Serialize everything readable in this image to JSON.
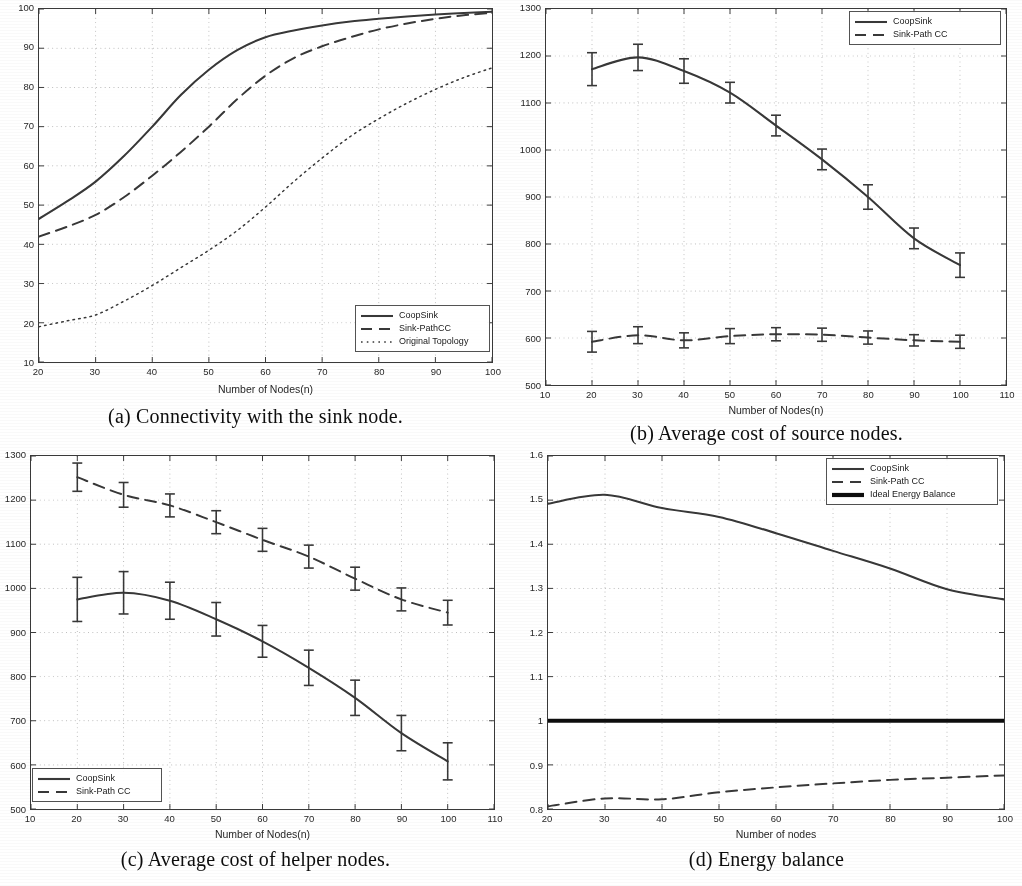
{
  "figure": {
    "panels": [
      "a",
      "b",
      "c",
      "d"
    ],
    "colors": {
      "line": "#3b3b3b",
      "thick": "#111111",
      "grid": "#b9b9b9",
      "axis": "#3c3c3c",
      "text": "#222222"
    }
  },
  "panel_a": {
    "caption": "(a) Connectivity with the sink node.",
    "xlabel": "Number of Nodes(n)",
    "ylabel": "",
    "xticks": [
      "20",
      "30",
      "40",
      "50",
      "60",
      "70",
      "80",
      "90",
      "100"
    ],
    "yticks": [
      "100",
      "90",
      "80",
      "70",
      "60",
      "50",
      "40",
      "30",
      "20",
      "10"
    ],
    "legend": [
      {
        "label": "CoopSink",
        "style": "solid"
      },
      {
        "label": "Sink-PathCC",
        "style": "dashed"
      },
      {
        "label": "Original Topology",
        "style": "dotted"
      }
    ]
  },
  "panel_b": {
    "caption": "(b) Average cost of source nodes.",
    "xlabel": "Number of Nodes(n)",
    "ylabel": "",
    "xticks": [
      "10",
      "20",
      "30",
      "40",
      "50",
      "60",
      "70",
      "80",
      "90",
      "100",
      "110"
    ],
    "yticks": [
      "1300",
      "1200",
      "1100",
      "1000",
      "900",
      "800",
      "700",
      "600",
      "500"
    ],
    "legend": [
      {
        "label": "CoopSink",
        "style": "solid"
      },
      {
        "label": "Sink-Path CC",
        "style": "dashed"
      }
    ]
  },
  "panel_c": {
    "caption": "(c) Average cost of helper nodes.",
    "xlabel": "Number of Nodes(n)",
    "ylabel": "",
    "xticks": [
      "10",
      "20",
      "30",
      "40",
      "50",
      "60",
      "70",
      "80",
      "90",
      "100",
      "110"
    ],
    "yticks": [
      "1300",
      "1200",
      "1100",
      "1000",
      "900",
      "800",
      "700",
      "600",
      "500"
    ],
    "legend": [
      {
        "label": "CoopSink",
        "style": "solid"
      },
      {
        "label": "Sink-Path CC",
        "style": "dashed"
      }
    ]
  },
  "panel_d": {
    "caption": "(d) Energy balance",
    "xlabel": "Number of nodes",
    "ylabel": "",
    "xticks": [
      "20",
      "30",
      "40",
      "50",
      "60",
      "70",
      "80",
      "90",
      "100"
    ],
    "yticks": [
      "1.6",
      "1.5",
      "1.4",
      "1.3",
      "1.2",
      "1.1",
      "1",
      "0.9",
      "0.8"
    ],
    "legend": [
      {
        "label": "CoopSink",
        "style": "solid"
      },
      {
        "label": "Sink-Path CC",
        "style": "dashed"
      },
      {
        "label": "Ideal Energy Balance",
        "style": "thick"
      }
    ]
  },
  "chart_data": [
    {
      "id": "a",
      "type": "line",
      "title": "(a) Connectivity with the sink node.",
      "xlabel": "Number of Nodes(n)",
      "ylabel": "",
      "xlim": [
        20,
        100
      ],
      "ylim": [
        10,
        100
      ],
      "grid": true,
      "legend_position": "lower-right",
      "x": [
        20,
        25,
        30,
        35,
        40,
        45,
        50,
        55,
        60,
        65,
        70,
        75,
        80,
        85,
        90,
        95,
        100
      ],
      "series": [
        {
          "name": "CoopSink",
          "style": "solid",
          "values": [
            46.5,
            51.0,
            56.0,
            62.5,
            70.0,
            78.0,
            84.5,
            89.5,
            92.8,
            94.5,
            95.8,
            96.8,
            97.5,
            98.1,
            98.6,
            99.0,
            99.3
          ]
        },
        {
          "name": "Sink-PathCC",
          "style": "dashed",
          "values": [
            42.0,
            44.5,
            47.5,
            52.0,
            57.5,
            63.5,
            70.0,
            77.0,
            83.0,
            87.5,
            90.5,
            92.8,
            94.8,
            96.3,
            97.5,
            98.4,
            99.0
          ]
        },
        {
          "name": "Original Topology",
          "style": "dotted",
          "values": [
            19.0,
            20.5,
            22.0,
            25.5,
            29.5,
            34.0,
            38.5,
            43.5,
            49.5,
            56.0,
            62.0,
            67.5,
            72.0,
            76.0,
            79.5,
            82.5,
            85.0
          ]
        }
      ]
    },
    {
      "id": "b",
      "type": "line",
      "title": "(b) Average cost of source nodes.",
      "xlabel": "Number of Nodes(n)",
      "ylabel": "",
      "xlim": [
        10,
        110
      ],
      "ylim": [
        500,
        1300
      ],
      "grid": true,
      "legend_position": "upper-right",
      "errorbars": true,
      "x": [
        20,
        30,
        40,
        50,
        60,
        70,
        80,
        90,
        100
      ],
      "series": [
        {
          "name": "CoopSink",
          "style": "solid",
          "values": [
            1172,
            1197,
            1168,
            1122,
            1052,
            980,
            900,
            812,
            755
          ],
          "errors": [
            35,
            28,
            26,
            22,
            22,
            22,
            26,
            22,
            26
          ]
        },
        {
          "name": "Sink-Path CC",
          "style": "dashed",
          "values": [
            592,
            606,
            595,
            604,
            608,
            607,
            601,
            595,
            592
          ],
          "errors": [
            22,
            18,
            16,
            16,
            14,
            14,
            14,
            12,
            14
          ]
        }
      ]
    },
    {
      "id": "c",
      "type": "line",
      "title": "(c) Average cost of helper nodes.",
      "xlabel": "Number of Nodes(n)",
      "ylabel": "",
      "xlim": [
        10,
        110
      ],
      "ylim": [
        500,
        1300
      ],
      "grid": true,
      "legend_position": "lower-left",
      "errorbars": true,
      "x": [
        20,
        30,
        40,
        50,
        60,
        70,
        80,
        90,
        100
      ],
      "series": [
        {
          "name": "CoopSink",
          "style": "solid",
          "values": [
            975,
            990,
            972,
            930,
            880,
            820,
            752,
            672,
            608
          ],
          "errors": [
            50,
            48,
            42,
            38,
            36,
            40,
            40,
            40,
            42
          ]
        },
        {
          "name": "Sink-Path CC",
          "style": "dashed",
          "values": [
            1252,
            1212,
            1188,
            1150,
            1110,
            1072,
            1022,
            975,
            945
          ],
          "errors": [
            32,
            28,
            26,
            26,
            26,
            26,
            26,
            26,
            28
          ]
        }
      ]
    },
    {
      "id": "d",
      "type": "line",
      "title": "(d) Energy balance",
      "xlabel": "Number of nodes",
      "ylabel": "",
      "xlim": [
        20,
        100
      ],
      "ylim": [
        0.8,
        1.6
      ],
      "grid": true,
      "legend_position": "upper-right",
      "x": [
        20,
        30,
        40,
        50,
        60,
        70,
        80,
        90,
        100
      ],
      "series": [
        {
          "name": "CoopSink",
          "style": "solid",
          "values": [
            1.492,
            1.512,
            1.482,
            1.462,
            1.425,
            1.385,
            1.345,
            1.298,
            1.275
          ]
        },
        {
          "name": "Sink-Path CC",
          "style": "dashed",
          "values": [
            0.806,
            0.824,
            0.822,
            0.838,
            0.849,
            0.858,
            0.866,
            0.871,
            0.876
          ]
        },
        {
          "name": "Ideal Energy Balance",
          "style": "thick",
          "values": [
            1.0,
            1.0,
            1.0,
            1.0,
            1.0,
            1.0,
            1.0,
            1.0,
            1.0
          ]
        }
      ]
    }
  ]
}
